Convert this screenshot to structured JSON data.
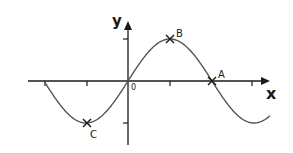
{
  "diagram": {
    "type": "sine-curve-graph",
    "axes": {
      "x_label": "x",
      "y_label": "y",
      "origin_label": "0"
    },
    "points": [
      {
        "label": "A",
        "description": "zero crossing on x-axis",
        "x_px": 212,
        "y_px": 81
      },
      {
        "label": "B",
        "description": "maximum",
        "x_px": 170,
        "y_px": 39
      },
      {
        "label": "C",
        "description": "minimum",
        "x_px": 87,
        "y_px": 123
      }
    ],
    "colors": {
      "axis": "#1a1a1a",
      "curve": "#555555"
    }
  }
}
